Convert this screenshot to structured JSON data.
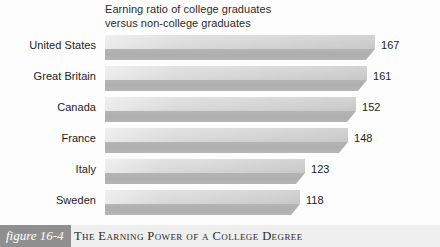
{
  "figure": {
    "badge_label": "figure 16-4",
    "caption": "The Earning Power of a College Degree",
    "badge_color": "#8f8f8f",
    "band_color": "#efefef"
  },
  "chart_data": {
    "type": "bar",
    "orientation": "horizontal",
    "title": "Earning ratio of college graduates\nversus non-college graduates",
    "xlabel": "",
    "ylabel": "",
    "grid": false,
    "legend": null,
    "bar_color": "#cfcfcf",
    "bar_shadow_color": "#aeaeae",
    "categories": [
      "United States",
      "Great Britain",
      "Canada",
      "France",
      "Italy",
      "Sweden"
    ],
    "values": [
      167,
      161,
      152,
      148,
      123,
      118
    ],
    "value_labels": [
      "167",
      "161",
      "152",
      "148",
      "123",
      "118"
    ],
    "xlim": [
      100,
      175
    ],
    "bars": [
      {
        "label": "United States",
        "value": 167,
        "value_label": "167",
        "width_px": 270
      },
      {
        "label": "Great Britain",
        "value": 161,
        "value_label": "161",
        "width_px": 262
      },
      {
        "label": "Canada",
        "value": 152,
        "value_label": "152",
        "width_px": 251
      },
      {
        "label": "France",
        "value": 148,
        "value_label": "148",
        "width_px": 243
      },
      {
        "label": "Italy",
        "value": 123,
        "value_label": "123",
        "width_px": 200
      },
      {
        "label": "Sweden",
        "value": 118,
        "value_label": "118",
        "width_px": 195
      }
    ]
  }
}
